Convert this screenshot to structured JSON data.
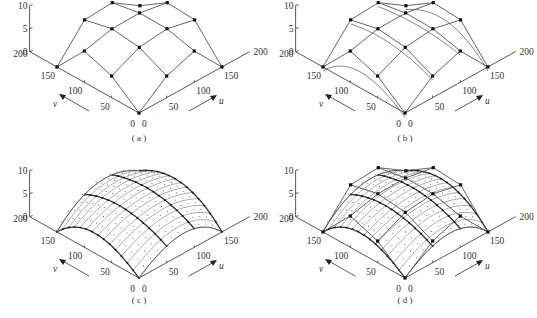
{
  "figure": {
    "panels": [
      {
        "id": "a",
        "caption": "( a )",
        "ox": 0,
        "oy": 0,
        "style": "grid"
      },
      {
        "id": "b",
        "caption": "( b )",
        "ox": 266,
        "oy": 0,
        "style": "grid-curves"
      },
      {
        "id": "c",
        "caption": "( c )",
        "ox": 0,
        "oy": 165,
        "style": "ruled"
      },
      {
        "id": "d",
        "caption": "( d )",
        "ox": 266,
        "oy": 165,
        "style": "ruled-grid"
      }
    ],
    "axes": {
      "z_ticks": [
        "10",
        "5",
        "0"
      ],
      "v_ticks": [
        "200",
        "150",
        "100",
        "50",
        "0"
      ],
      "u_ticks": [
        "0",
        "50",
        "100",
        "150",
        "200"
      ],
      "u_label": "u",
      "v_label": "v"
    }
  },
  "chart_data": {
    "type": "surface-3d",
    "title": "",
    "panels": [
      "(a)",
      "(b)",
      "(c)",
      "(d)"
    ],
    "xlabel": "u",
    "ylabel": "v",
    "zlabel": "",
    "u_range": [
      0,
      200
    ],
    "v_range": [
      0,
      200
    ],
    "z_range": [
      0,
      10
    ],
    "u_ticks": [
      0,
      50,
      100,
      150,
      200
    ],
    "v_ticks": [
      0,
      50,
      100,
      150,
      200
    ],
    "z_ticks": [
      0,
      5,
      10
    ],
    "control_grid_uv": [
      0,
      50,
      100,
      150
    ]
  }
}
